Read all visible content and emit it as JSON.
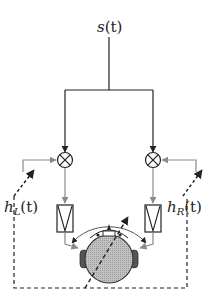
{
  "diagram": {
    "type": "binaural-signal-processing-block-diagram",
    "source": {
      "label_main": "s",
      "label_arg": "(t)"
    },
    "left_channel": {
      "channel_label": {
        "main": "h",
        "sub": "L",
        "arg": "(t)"
      },
      "multiplier_symbol": "×",
      "filter": "bandpass-filter-block"
    },
    "right_channel": {
      "channel_label": {
        "main": "h",
        "sub": "R",
        "arg": "(t)"
      },
      "multiplier_symbol": "×",
      "filter": "bandpass-filter-block"
    },
    "listener": {
      "head": "head-top-view",
      "ears": [
        "left-ear",
        "right-ear"
      ]
    },
    "feedback_loop": {
      "style": "dashed"
    },
    "colors": {
      "line": "#222222",
      "gray_line": "#8a8a8a",
      "head_fill": "#b5b5b5",
      "ear_fill": "#555555"
    }
  }
}
